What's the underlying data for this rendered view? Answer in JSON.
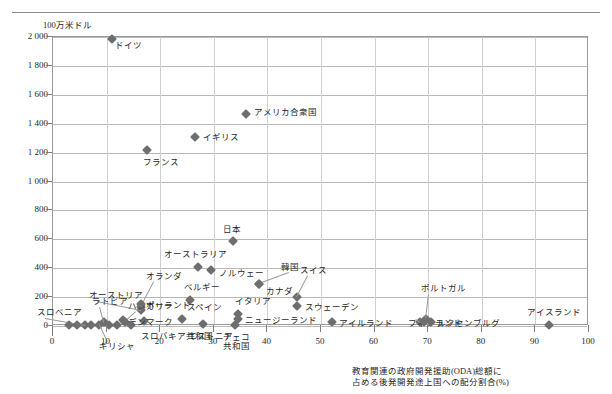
{
  "figure": {
    "y_axis_unit": "100万米ドル",
    "x_caption_line1": "教育関連の政府開発援助(ODA)総額に",
    "x_caption_line2": "占める後発開発途上国への配分割合(%)",
    "marker_color": "#6e6e6e",
    "gridline_color": "#b9b9b9",
    "frame_color": "#9a9a9a"
  },
  "chart_data": {
    "type": "scatter",
    "title": "",
    "subtitle": "",
    "xlabel": "教育関連の政府開発援助(ODA)総額に占める後発開発途上国への配分割合(%)",
    "ylabel": "100万米ドル",
    "xlim": [
      0,
      100
    ],
    "ylim": [
      0,
      2000
    ],
    "xticks": [
      0,
      10,
      20,
      30,
      40,
      50,
      60,
      70,
      80,
      90,
      100
    ],
    "yticks": [
      0,
      200,
      400,
      600,
      800,
      1000,
      1200,
      1400,
      1600,
      1800,
      2000
    ],
    "xtick_labels": [
      "0",
      "10",
      "20",
      "30",
      "40",
      "50",
      "60",
      "70",
      "80",
      "90",
      "100"
    ],
    "ytick_labels": [
      "0",
      "200",
      "400",
      "600",
      "800",
      "1 000",
      "1 200",
      "1 400",
      "1 600",
      "1 800",
      "2 000"
    ],
    "grid": "horizontal-major-and-vertical",
    "legend": "none",
    "points": [
      {
        "label": "ドイツ",
        "x": 11.0,
        "y": 1985,
        "lx": 3,
        "ly": 7,
        "anchor": "left"
      },
      {
        "label": "アメリカ合衆国",
        "x": 36.0,
        "y": 1470,
        "lx": 8,
        "ly": -1,
        "anchor": "left"
      },
      {
        "label": "イギリス",
        "x": 26.5,
        "y": 1310,
        "lx": 8,
        "ly": 1,
        "anchor": "left"
      },
      {
        "label": "フランス",
        "x": 17.5,
        "y": 1215,
        "lx": -4,
        "ly": 13,
        "anchor": "left"
      },
      {
        "label": "日本",
        "x": 33.5,
        "y": 588,
        "lx": -10,
        "ly": -11,
        "anchor": "left"
      },
      {
        "label": "オーストラリア",
        "x": 27.0,
        "y": 408,
        "lx": -34,
        "ly": -12,
        "anchor": "left"
      },
      {
        "label": "ノルウェー",
        "x": 29.5,
        "y": 385,
        "lx": 8,
        "ly": 4,
        "anchor": "left"
      },
      {
        "label": "韓国",
        "x": 38.5,
        "y": 290,
        "lx": 22,
        "ly": -16,
        "anchor": "left",
        "leader": true
      },
      {
        "label": "スイス",
        "x": 45.5,
        "y": 198,
        "lx": 3,
        "ly": -26,
        "anchor": "left",
        "leader": true
      },
      {
        "label": "カナダ",
        "x": 38.5,
        "y": 290,
        "lx": 7,
        "ly": 8,
        "anchor": "left"
      },
      {
        "label": "ベルギー",
        "x": 25.5,
        "y": 180,
        "lx": -6,
        "ly": -12,
        "anchor": "left"
      },
      {
        "label": "オランダ",
        "x": 16.5,
        "y": 130,
        "lx": 5,
        "ly": -30,
        "anchor": "left",
        "leader": true
      },
      {
        "label": "オーストリア",
        "x": 16.5,
        "y": 110,
        "lx": -52,
        "ly": -14,
        "anchor": "left",
        "leader": true
      },
      {
        "label": "ポルトガル",
        "x": 69.5,
        "y": 45,
        "lx": -5,
        "ly": -30,
        "anchor": "left",
        "leader": true
      },
      {
        "label": "スウェーデン",
        "x": 45.5,
        "y": 140,
        "lx": 8,
        "ly": 2,
        "anchor": "left"
      },
      {
        "label": "イタリア",
        "x": 34.5,
        "y": 85,
        "lx": -3,
        "ly": -12,
        "anchor": "left"
      },
      {
        "label": "スペイン",
        "x": 24.0,
        "y": 45,
        "lx": 5,
        "ly": -11,
        "anchor": "left"
      },
      {
        "label": "ハンガリー",
        "x": 13.5,
        "y": 25,
        "lx": 3,
        "ly": -15,
        "anchor": "left",
        "leader": true
      },
      {
        "label": "ポーランド",
        "x": 17.0,
        "y": 35,
        "lx": 2,
        "ly": -15,
        "anchor": "left"
      },
      {
        "label": "デンマーク",
        "x": 13.0,
        "y": 42,
        "lx": 5,
        "ly": 3,
        "anchor": "left"
      },
      {
        "label": "ニュージーランド",
        "x": 34.5,
        "y": 50,
        "lx": 7,
        "ly": 2,
        "anchor": "left"
      },
      {
        "label": "アイルランド",
        "x": 52.0,
        "y": 25,
        "lx": 7,
        "ly": 2,
        "anchor": "left"
      },
      {
        "label": "フィンランド",
        "x": 68.5,
        "y": 25,
        "lx": -12,
        "ly": 2,
        "anchor": "left",
        "leader": true
      },
      {
        "label": "ルクセンブルグ",
        "x": 70.5,
        "y": 25,
        "lx": 6,
        "ly": 2,
        "anchor": "left"
      },
      {
        "label": "アイスランド",
        "x": 92.5,
        "y": 8,
        "lx": -22,
        "ly": -12,
        "anchor": "left"
      },
      {
        "label": "エストニア",
        "x": 28.0,
        "y": 12,
        "lx": -15,
        "ly": 13,
        "anchor": "left"
      },
      {
        "label": "チェコ共和国",
        "x": 34.0,
        "y": 8,
        "lx": -12,
        "ly": 13,
        "anchor": "left",
        "two_line": true
      },
      {
        "label": "スロバキア共和国",
        "x": 14.5,
        "y": 8,
        "lx": 10,
        "ly": 12,
        "anchor": "left"
      },
      {
        "label": "ギリシャ",
        "x": 8.5,
        "y": 5,
        "lx": 0,
        "ly": 22,
        "anchor": "left",
        "leader": true
      },
      {
        "label": "ラトビア",
        "x": 9.5,
        "y": 28,
        "lx": -12,
        "ly": -20,
        "anchor": "left",
        "leader": true
      },
      {
        "label": "スロベニア",
        "x": 6.0,
        "y": 10,
        "lx": -48,
        "ly": -12,
        "anchor": "left",
        "leader": true
      },
      {
        "label": "",
        "x": 3.0,
        "y": 5,
        "lx": 0,
        "ly": 0,
        "anchor": "left"
      },
      {
        "label": "",
        "x": 4.5,
        "y": 5,
        "lx": 0,
        "ly": 0,
        "anchor": "left"
      },
      {
        "label": "",
        "x": 7.0,
        "y": 8,
        "lx": 0,
        "ly": 0,
        "anchor": "left"
      },
      {
        "label": "",
        "x": 10.5,
        "y": 10,
        "lx": 0,
        "ly": 0,
        "anchor": "left"
      },
      {
        "label": "",
        "x": 12.0,
        "y": 8,
        "lx": 0,
        "ly": 0,
        "anchor": "left"
      },
      {
        "label": "",
        "x": 16.5,
        "y": 150,
        "lx": 0,
        "ly": 0,
        "anchor": "left"
      },
      {
        "label": "",
        "x": 69.2,
        "y": 25,
        "lx": 0,
        "ly": 0,
        "anchor": "left"
      }
    ]
  }
}
